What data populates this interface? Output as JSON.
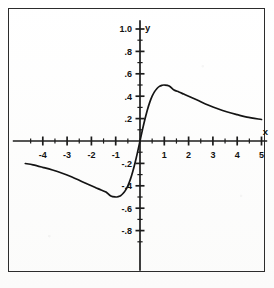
{
  "figure": {
    "kind": "cartesian-function-plot",
    "axis_label_x": "x",
    "axis_label_y": "y",
    "border_color": "#2c2c2c",
    "curve_color": "#141414",
    "background_color": "#fdfdfc"
  },
  "chart_data": {
    "type": "line",
    "title": "",
    "xlabel": "x",
    "ylabel": "y",
    "xlim": [
      -5,
      5
    ],
    "ylim": [
      -1.0,
      1.0
    ],
    "grid": false,
    "legend": "none",
    "x_major_ticks": [
      -4,
      -3,
      -2,
      -1,
      1,
      2,
      3,
      4,
      5
    ],
    "x_major_tick_labels": [
      "-4",
      "-3",
      "-2",
      "-1",
      "1",
      "2",
      "3",
      "4",
      "5"
    ],
    "x_minor_tick_step": 0.5,
    "y_major_ticks": [
      1.0,
      0.8,
      0.6,
      0.4,
      0.2,
      -0.2,
      -0.4,
      -0.6,
      -0.8
    ],
    "y_major_tick_labels": [
      "1.0",
      ".8",
      ".6",
      ".4",
      ".2",
      "-.2",
      "-.4",
      "-.6",
      "-.8"
    ],
    "y_minor_tick_step": 0.1,
    "series": [
      {
        "name": "f(x)",
        "x": [
          -4.72,
          -4.4,
          -4.0,
          -3.6,
          -3.2,
          -2.8,
          -2.4,
          -2.0,
          -1.8,
          -1.6,
          -1.4,
          -1.2,
          -1.0,
          -0.9,
          -0.8,
          -0.7,
          -0.6,
          -0.5,
          -0.4,
          -0.3,
          -0.2,
          -0.1,
          0.0,
          0.1,
          0.2,
          0.3,
          0.4,
          0.5,
          0.6,
          0.7,
          0.8,
          0.9,
          1.0,
          1.2,
          1.4,
          1.6,
          1.8,
          2.0,
          2.4,
          2.8,
          3.2,
          3.6,
          4.0,
          4.4,
          5.0
        ],
        "y": [
          -0.201,
          -0.213,
          -0.235,
          -0.259,
          -0.288,
          -0.322,
          -0.361,
          -0.4,
          -0.419,
          -0.438,
          -0.456,
          -0.492,
          -0.5,
          -0.497,
          -0.488,
          -0.469,
          -0.441,
          -0.4,
          -0.345,
          -0.275,
          -0.192,
          -0.099,
          0.0,
          0.099,
          0.192,
          0.275,
          0.345,
          0.4,
          0.441,
          0.469,
          0.488,
          0.497,
          0.5,
          0.492,
          0.456,
          0.438,
          0.419,
          0.4,
          0.361,
          0.322,
          0.288,
          0.259,
          0.235,
          0.213,
          0.192
        ],
        "annotation": "odd function, maximum 0.5 at x=1, minimum -0.5 at x=-1, decays toward 0"
      }
    ]
  }
}
